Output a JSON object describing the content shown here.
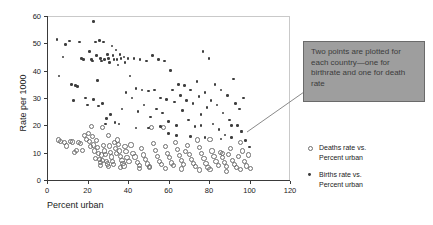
{
  "chart_data": {
    "type": "scatter",
    "title": "",
    "xlabel": "Percent urban",
    "ylabel": "Rate per 1000",
    "xlim": [
      0,
      120
    ],
    "ylim": [
      0,
      60
    ],
    "xticks": [
      0,
      20,
      40,
      60,
      80,
      100,
      120
    ],
    "yticks": [
      0,
      10,
      20,
      30,
      40,
      50,
      60
    ],
    "grid": false,
    "legend_position": "right",
    "series": [
      {
        "name": "Deaths rate vs. Percent urban",
        "marker": "open-circle",
        "color": "#6e6e6e",
        "points": [
          [
            5,
            15
          ],
          [
            6,
            14.5
          ],
          [
            8,
            14.2
          ],
          [
            9,
            12.8
          ],
          [
            11,
            14.5
          ],
          [
            12,
            14.3
          ],
          [
            13,
            10.5
          ],
          [
            14,
            11.2
          ],
          [
            15,
            14.2
          ],
          [
            16,
            13.6
          ],
          [
            17,
            11.3
          ],
          [
            18,
            16.5
          ],
          [
            19,
            15.2
          ],
          [
            20,
            17.5
          ],
          [
            20.5,
            14.5
          ],
          [
            21,
            12.6
          ],
          [
            21.5,
            19.8
          ],
          [
            22,
            16.3
          ],
          [
            22.5,
            13.2
          ],
          [
            23,
            11.0
          ],
          [
            23.5,
            8.2
          ],
          [
            24,
            14.8
          ],
          [
            24.5,
            12.3
          ],
          [
            25,
            10.2
          ],
          [
            25.5,
            8.0
          ],
          [
            26,
            6.8
          ],
          [
            26.5,
            9.5
          ],
          [
            26.8,
            7.4
          ],
          [
            27,
            19.5
          ],
          [
            27.5,
            13.0
          ],
          [
            28,
            11.0
          ],
          [
            28.5,
            9.8
          ],
          [
            29,
            7.0
          ],
          [
            29.5,
            6.2
          ],
          [
            30,
            16.5
          ],
          [
            30.5,
            12.8
          ],
          [
            31,
            10.5
          ],
          [
            31.5,
            8.8
          ],
          [
            32,
            7.2
          ],
          [
            32.5,
            6.0
          ],
          [
            33,
            14.0
          ],
          [
            33.5,
            12.0
          ],
          [
            34,
            10.0
          ],
          [
            34.5,
            15.0
          ],
          [
            35,
            13.5
          ],
          [
            35.5,
            11.0
          ],
          [
            36,
            9.0
          ],
          [
            36.5,
            7.5
          ],
          [
            37,
            6.5
          ],
          [
            37.5,
            5.5
          ],
          [
            38,
            12.5
          ],
          [
            38.5,
            10.8
          ],
          [
            39,
            8.5
          ],
          [
            40,
            7.0
          ],
          [
            41,
            13.2
          ],
          [
            42,
            10.0
          ],
          [
            43,
            8.8
          ],
          [
            44,
            6.8
          ],
          [
            45,
            5.8
          ],
          [
            46,
            12.0
          ],
          [
            47,
            9.5
          ],
          [
            48,
            7.8
          ],
          [
            49,
            6.2
          ],
          [
            50,
            5.4
          ],
          [
            51,
            19.5
          ],
          [
            52,
            13.8
          ],
          [
            53,
            11.2
          ],
          [
            54,
            9.0
          ],
          [
            55,
            7.2
          ],
          [
            56,
            6.0
          ],
          [
            57,
            19.6
          ],
          [
            58,
            12.5
          ],
          [
            59,
            10.0
          ],
          [
            60,
            8.5
          ],
          [
            61,
            6.6
          ],
          [
            62,
            5.6
          ],
          [
            63,
            14.2
          ],
          [
            64,
            11.5
          ],
          [
            65,
            9.2
          ],
          [
            66,
            7.4
          ],
          [
            67,
            6.1
          ],
          [
            68,
            10.8
          ],
          [
            69,
            13.0
          ],
          [
            70,
            9.8
          ],
          [
            71,
            8.0
          ],
          [
            72,
            6.4
          ],
          [
            73,
            5.2
          ],
          [
            74,
            15.0
          ],
          [
            75,
            12.2
          ],
          [
            76,
            10.0
          ],
          [
            77,
            8.2
          ],
          [
            78,
            6.5
          ],
          [
            79,
            5.0
          ],
          [
            80,
            15.2
          ],
          [
            81,
            11.0
          ],
          [
            82,
            9.0
          ],
          [
            83,
            7.2
          ],
          [
            84,
            5.8
          ],
          [
            85,
            10.5
          ],
          [
            86,
            8.6
          ],
          [
            87,
            6.8
          ],
          [
            88,
            5.4
          ],
          [
            89,
            9.8
          ],
          [
            90,
            12.0
          ],
          [
            91,
            7.6
          ],
          [
            92,
            6.0
          ],
          [
            93,
            4.8
          ],
          [
            94,
            9.0
          ],
          [
            95,
            14.0
          ],
          [
            96,
            11.0
          ],
          [
            97,
            7.0
          ],
          [
            98,
            5.5
          ],
          [
            99,
            9.5
          ],
          [
            100,
            4.6
          ],
          [
            88,
            3.5
          ],
          [
            80,
            4.2
          ],
          [
            75,
            4.0
          ],
          [
            66,
            4.4
          ],
          [
            58,
            4.6
          ],
          [
            50,
            4.8
          ],
          [
            45,
            4.5
          ],
          [
            36,
            5.0
          ],
          [
            30,
            5.2
          ],
          [
            26,
            5.6
          ],
          [
            95,
            4.2
          ],
          [
            86,
            10.2
          ]
        ]
      },
      {
        "name": "Births rate vs. Percent urban",
        "marker": "filled-circle",
        "color": "#3d3d3d",
        "points": [
          [
            5,
            51.5
          ],
          [
            6,
            38.0
          ],
          [
            8,
            45.0
          ],
          [
            9,
            49.5
          ],
          [
            11,
            50.8
          ],
          [
            12,
            35.0
          ],
          [
            13,
            29.0
          ],
          [
            14,
            34.5
          ],
          [
            15,
            34.2
          ],
          [
            16,
            50.5
          ],
          [
            17,
            44.5
          ],
          [
            18,
            44.0
          ],
          [
            19,
            30.0
          ],
          [
            20,
            27.5
          ],
          [
            21,
            47.0
          ],
          [
            22,
            44.0
          ],
          [
            22.5,
            43.5
          ],
          [
            23,
            29.5
          ],
          [
            24,
            50.5
          ],
          [
            24.5,
            45.5
          ],
          [
            25,
            36.5
          ],
          [
            25.5,
            27.0
          ],
          [
            26,
            51.0
          ],
          [
            26.5,
            44.5
          ],
          [
            27,
            43.5
          ],
          [
            27.5,
            28.0
          ],
          [
            28,
            50.5
          ],
          [
            28.5,
            44.0
          ],
          [
            29,
            20.5
          ],
          [
            29.5,
            22.5
          ],
          [
            30,
            46.0
          ],
          [
            30.5,
            44.5
          ],
          [
            31,
            43.0
          ],
          [
            31.5,
            24.0
          ],
          [
            32,
            49.0
          ],
          [
            32.5,
            45.5
          ],
          [
            33,
            44.0
          ],
          [
            33.5,
            21.0
          ],
          [
            34,
            47.5
          ],
          [
            34.5,
            44.0
          ],
          [
            35,
            42.0
          ],
          [
            35.5,
            20.5
          ],
          [
            36,
            46.0
          ],
          [
            36.5,
            44.5
          ],
          [
            37,
            26.0
          ],
          [
            38,
            45.0
          ],
          [
            38.5,
            43.0
          ],
          [
            39,
            32.0
          ],
          [
            40,
            44.5
          ],
          [
            41,
            38.0
          ],
          [
            42,
            30.0
          ],
          [
            43,
            44.5
          ],
          [
            44,
            33.5
          ],
          [
            45,
            25.0
          ],
          [
            46,
            44.0
          ],
          [
            47,
            33.0
          ],
          [
            48,
            27.5
          ],
          [
            49,
            43.5
          ],
          [
            50,
            32.5
          ],
          [
            51,
            23.0
          ],
          [
            52,
            45.5
          ],
          [
            53,
            33.0
          ],
          [
            54,
            26.0
          ],
          [
            55,
            44.0
          ],
          [
            56,
            30.0
          ],
          [
            57,
            24.5
          ],
          [
            58,
            43.5
          ],
          [
            59,
            29.5
          ],
          [
            60,
            21.5
          ],
          [
            61,
            40.0
          ],
          [
            62,
            33.0
          ],
          [
            63,
            28.5
          ],
          [
            64,
            20.0
          ],
          [
            65,
            35.0
          ],
          [
            66,
            31.0
          ],
          [
            67,
            25.5
          ],
          [
            68,
            34.5
          ],
          [
            69,
            29.0
          ],
          [
            70,
            22.0
          ],
          [
            71,
            33.0
          ],
          [
            72,
            28.0
          ],
          [
            73,
            19.5
          ],
          [
            74,
            36.0
          ],
          [
            75,
            30.5
          ],
          [
            76,
            24.0
          ],
          [
            77,
            47.0
          ],
          [
            78,
            32.0
          ],
          [
            79,
            26.5
          ],
          [
            80,
            44.5
          ],
          [
            81,
            29.0
          ],
          [
            82,
            20.5
          ],
          [
            83,
            35.0
          ],
          [
            84,
            27.5
          ],
          [
            85,
            18.5
          ],
          [
            86,
            33.0
          ],
          [
            87,
            24.5
          ],
          [
            88,
            16.5
          ],
          [
            89,
            31.0
          ],
          [
            90,
            22.0
          ],
          [
            91,
            15.5
          ],
          [
            92,
            37.0
          ],
          [
            93,
            28.0
          ],
          [
            94,
            20.0
          ],
          [
            95,
            26.0
          ],
          [
            96,
            18.0
          ],
          [
            97,
            30.0
          ],
          [
            98,
            14.5
          ],
          [
            23,
            58.0
          ],
          [
            50,
            19.0
          ],
          [
            56,
            19.5
          ],
          [
            44,
            19.0
          ],
          [
            78,
            15.5
          ],
          [
            71,
            16.0
          ],
          [
            64,
            16.2
          ],
          [
            86,
            15.0
          ],
          [
            91,
            20.0
          ],
          [
            76,
            20.0
          ],
          [
            96,
            17.5
          ],
          [
            60,
            17.0
          ],
          [
            100,
            12.0
          ]
        ]
      }
    ]
  },
  "axes": {
    "xlabel": "Percent urban",
    "ylabel": "Rate per 1000",
    "xticks": [
      "0",
      "20",
      "40",
      "60",
      "80",
      "100",
      "120"
    ],
    "yticks": [
      "0",
      "10",
      "20",
      "30",
      "40",
      "50",
      "60"
    ]
  },
  "legend": {
    "entries": [
      {
        "marker": "open-circle",
        "line1": "Deaths rate vs.",
        "line2": "Percent urban"
      },
      {
        "marker": "filled-circle",
        "line1": "Births rate vs.",
        "line2": "Percent urban"
      }
    ]
  },
  "callout": {
    "text": "Two points are plotted for each country—one for birthrate and one for death rate",
    "background": "#9e9e9e",
    "border": "#6a6a6a"
  }
}
